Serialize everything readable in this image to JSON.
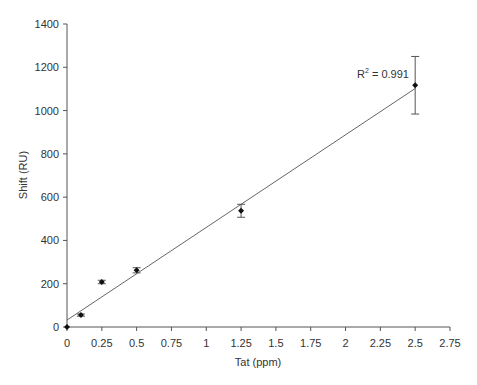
{
  "chart_data": {
    "type": "scatter",
    "title": "",
    "xlabel": "Tat (ppm)",
    "ylabel": "Shift (RU)",
    "xlim": [
      0,
      2.75
    ],
    "ylim": [
      0,
      1400
    ],
    "xticks": [
      0,
      0.25,
      0.5,
      0.75,
      1,
      1.25,
      1.5,
      1.75,
      2,
      2.25,
      2.5,
      2.75
    ],
    "xtick_labels": [
      "0",
      "0.25",
      "0.5",
      "0.75",
      "1",
      "1.25",
      "1.5",
      "1.75",
      "2",
      "2.25",
      "2.5",
      "2.75"
    ],
    "yticks": [
      0,
      200,
      400,
      600,
      800,
      1000,
      1200,
      1400
    ],
    "ytick_labels": [
      "0",
      "200",
      "400",
      "600",
      "800",
      "1000",
      "1200",
      "1400"
    ],
    "grid": false,
    "legend": null,
    "series": [
      {
        "name": "Shift",
        "marker": "diamond",
        "x": [
          0,
          0.1,
          0.25,
          0.5,
          1.25,
          2.5
        ],
        "y": [
          0,
          55,
          208,
          262,
          537,
          1117
        ],
        "error": [
          0,
          5,
          8,
          12,
          30,
          133
        ]
      }
    ],
    "trendline": {
      "type": "linear",
      "intercept": 32,
      "slope": 428,
      "x_range": [
        0,
        2.5
      ]
    },
    "annotations": [
      {
        "text_main": "R",
        "text_sup": "2",
        "text_rest": " = 0.991",
        "x": 2.3,
        "y": 1180
      }
    ]
  },
  "colors": {
    "axis": "#555555",
    "marker": "#111111",
    "trendline": "#666666",
    "text": "#333333"
  }
}
